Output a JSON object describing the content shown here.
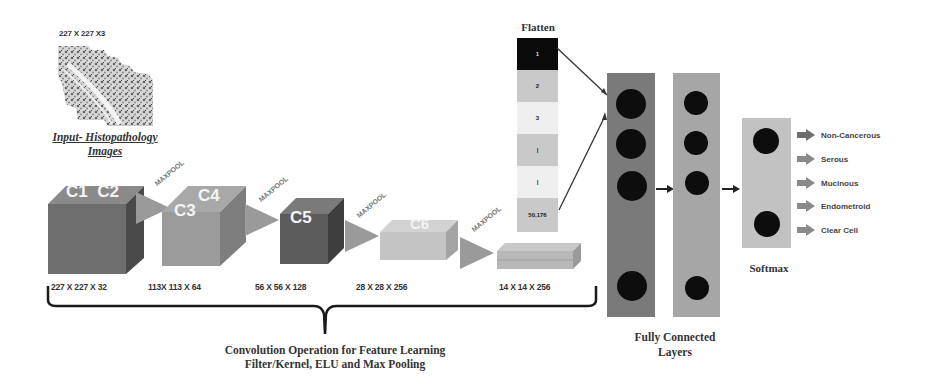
{
  "input": {
    "dimensions": "227 X 227 X3",
    "caption_line1": "Input- Histopathology",
    "caption_line2": "Images"
  },
  "conv_blocks": [
    {
      "label": "C1  C2",
      "dims": "227 X 227 X 32",
      "color": "#6e6e6e"
    },
    {
      "label": "C3  C4",
      "dims": "113X 113 X 64",
      "color": "#9b9b9b"
    },
    {
      "label": "C5",
      "dims": "56 X 56 X 128",
      "color": "#5c5c5c"
    },
    {
      "label": "C6",
      "dims": "28 X 28 X 256",
      "color": "#c4c4c4"
    },
    {
      "label": "",
      "dims": "14 X 14 X 256",
      "color": "#b8b8b8"
    }
  ],
  "pool_label": "MAXPOOL",
  "flatten": {
    "title": "Flatten",
    "cells": [
      {
        "text": "1",
        "color": "#0a0a0a",
        "text_color": "#ddd"
      },
      {
        "text": "2",
        "color": "#c9c9c9",
        "text_color": "#222"
      },
      {
        "text": "3",
        "color": "#efefef",
        "text_color": "#222"
      },
      {
        "text": "|",
        "color": "#c9c9c9",
        "text_color": "#222"
      },
      {
        "text": "|",
        "color": "#efefef",
        "text_color": "#222"
      },
      {
        "text": "50,176",
        "color": "#c9c9c9",
        "text_color": "#222"
      }
    ]
  },
  "fully_connected": {
    "caption_line1": "Fully Connected",
    "caption_line2": "Layers",
    "layer1_color": "#7a7a7a",
    "layer2_color": "#a6a6a6"
  },
  "softmax": {
    "title": "Softmax",
    "color": "#c2c2c2"
  },
  "classes": [
    "Non-Cancerous",
    "Serous",
    "Mucinous",
    "Endometroid",
    "Clear Cell"
  ],
  "conv_caption": {
    "line1": "Convolution Operation for Feature Learning",
    "line2": "Filter/Kernel, ELU and Max Pooling"
  }
}
